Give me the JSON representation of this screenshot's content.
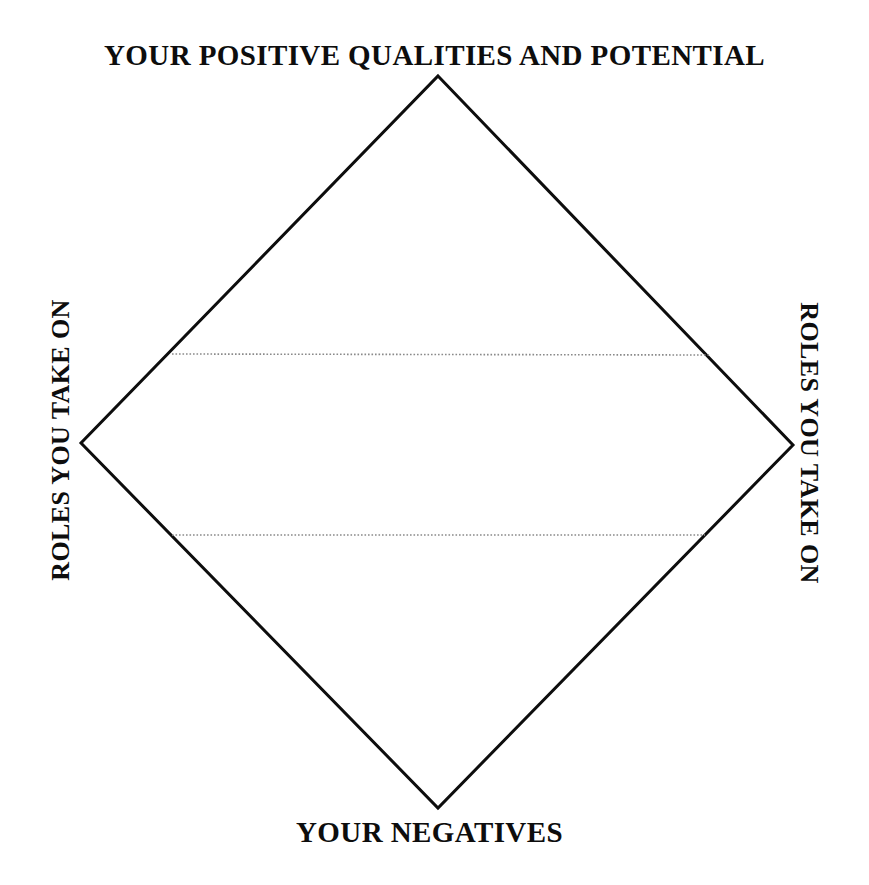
{
  "diagram": {
    "type": "diamond-quadrant-model",
    "canvas": {
      "width": 869,
      "height": 885,
      "background": "#ffffff"
    },
    "labels": {
      "top": "YOUR POSITIVE QUALITIES AND POTENTIAL",
      "bottom": "YOUR NEGATIVES",
      "left": "ROLES YOU TAKE ON",
      "right": "ROLES YOU TAKE ON"
    },
    "shape": {
      "name": "diamond-outline",
      "stroke_color": "#0d0d0d",
      "stroke_width": 3,
      "fill": "none",
      "vertices": {
        "top": {
          "x": 438,
          "y": 76
        },
        "right": {
          "x": 793,
          "y": 445
        },
        "bottom": {
          "x": 438,
          "y": 808
        },
        "left": {
          "x": 81,
          "y": 443
        }
      }
    },
    "divider_lines": [
      {
        "name": "upper-dotted-divider",
        "style": "dotted",
        "color": "#8a8a8a",
        "x1": 172,
        "y1": 354,
        "x2": 710,
        "y2": 355
      },
      {
        "name": "lower-dotted-divider",
        "style": "dotted",
        "color": "#8a8a8a",
        "x1": 172,
        "y1": 535,
        "x2": 705,
        "y2": 535
      }
    ]
  }
}
